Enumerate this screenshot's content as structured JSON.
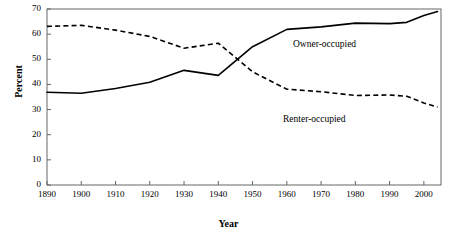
{
  "chart_data": {
    "type": "line",
    "title": "",
    "xlabel": "Year",
    "ylabel": "Percent",
    "xlim": [
      1890,
      2005
    ],
    "ylim": [
      0,
      70
    ],
    "xticks": [
      1890,
      1900,
      1910,
      1920,
      1930,
      1940,
      1950,
      1960,
      1970,
      1980,
      1990,
      2000
    ],
    "yticks": [
      0,
      10,
      20,
      30,
      40,
      50,
      60,
      70
    ],
    "grid": false,
    "legend_position": "inline-annotation",
    "x": [
      1890,
      1900,
      1910,
      1920,
      1930,
      1940,
      1950,
      1960,
      1970,
      1980,
      1990,
      1995,
      2000,
      2004
    ],
    "series": [
      {
        "name": "Owner-occupied",
        "style": "solid",
        "color": "#000000",
        "values": [
          36.9,
          36.5,
          38.4,
          40.9,
          45.6,
          43.6,
          55.0,
          61.9,
          62.9,
          64.4,
          64.2,
          64.7,
          67.4,
          69.0
        ]
      },
      {
        "name": "Renter-occupied",
        "style": "dashed",
        "color": "#000000",
        "values": [
          63.1,
          63.5,
          61.6,
          59.1,
          54.4,
          56.4,
          45.0,
          38.1,
          37.1,
          35.6,
          35.8,
          35.3,
          32.6,
          31.0
        ]
      }
    ],
    "annotations": [
      {
        "text": "Owner-occupied",
        "x": 1960,
        "y": 57
      },
      {
        "text": "Renter-occupied",
        "x": 1962,
        "y": 25
      }
    ]
  },
  "axis": {
    "ylabel": "Percent",
    "xlabel": "Year",
    "xtick_labels": [
      "1890",
      "1900",
      "1910",
      "1920",
      "1930",
      "1940",
      "1950",
      "1960",
      "1970",
      "1980",
      "1990",
      "2000"
    ],
    "ytick_labels": [
      "0",
      "10",
      "20",
      "30",
      "40",
      "50",
      "60",
      "70"
    ]
  },
  "labels": {
    "owner": "Owner-occupied",
    "renter": "Renter-occupied"
  },
  "colors": {
    "line": "#000000",
    "frame": "#555555",
    "background": "#ffffff"
  }
}
